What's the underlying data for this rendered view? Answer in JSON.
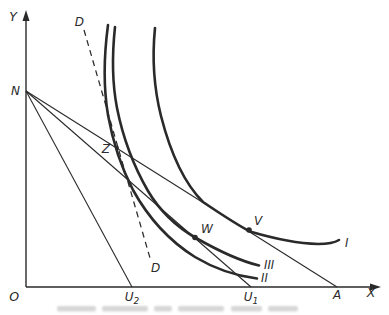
{
  "labels": {
    "y_axis": "Y",
    "x_axis": "X",
    "origin": "O",
    "n": "N",
    "d_top": "D",
    "d_bottom": "D",
    "z": "Z",
    "w": "W",
    "v": "V",
    "u_base": "U",
    "u2_sub": "2",
    "u1_sub": "1",
    "a": "A",
    "curve_i": "I",
    "curve_ii": "II",
    "curve_iii": "III"
  },
  "colors": {
    "ink": "#2a2a2a",
    "paper": "#ffffff",
    "smudge": "#c9c9c9"
  },
  "figure": {
    "y_axis": {
      "x1": 26,
      "y1": 287,
      "x2": 26,
      "y2": 17
    },
    "x_axis": {
      "x1": 26,
      "y1": 287,
      "x2": 375,
      "y2": 287
    },
    "y_arrow": {
      "points": "26,10 22.5,21 29.5,21"
    },
    "x_arrow": {
      "points": "381,287 370,283.5 370,290.5"
    },
    "line_n_u2": {
      "x1": 26,
      "y1": 91,
      "x2": 132,
      "y2": 287
    },
    "line_n_u1": {
      "x1": 26,
      "y1": 91,
      "x2": 251,
      "y2": 287
    },
    "line_n_a": {
      "x1": 26,
      "y1": 91,
      "x2": 337,
      "y2": 287
    },
    "d_line": {
      "x1": 84,
      "y1": 30,
      "x2": 150,
      "y2": 258
    },
    "curve_i": {
      "d": "M 155,28 C 152,58 154,88 161,116 C 171,155 184,183 203,202 C 221,214 234,223 250,231.5 C 272,238 297,243.5 318,244 C 329,244 335,242.5 339,240"
    },
    "curve_ii": {
      "d": "M 108,25 C 104,55 103,85 108,115 C 113,143 121,167 133,190 C 149,219 171,242 195,257 C 215,269 237,276 257,278.5"
    },
    "curve_iii": {
      "d": "M 115,27 C 112,55 112,82 117,108 C 123,138 133,165 148,191 C 161,213 177,227 196,238 C 217,250 240,261 259,265.5"
    },
    "dot_z": {
      "cx": 117,
      "cy": 148,
      "r": 2
    },
    "dot_w": {
      "cx": 195,
      "cy": 237.5,
      "r": 2.8
    },
    "dot_v": {
      "cx": 249,
      "cy": 230,
      "r": 2.8
    },
    "txt_y": {
      "x": 13,
      "y": 21,
      "text-anchor": "middle"
    },
    "txt_x": {
      "x": 371,
      "y": 297,
      "text-anchor": "middle"
    },
    "txt_o": {
      "x": 19,
      "y": 301,
      "text-anchor": "end"
    },
    "txt_n": {
      "x": 20,
      "y": 95,
      "text-anchor": "end"
    },
    "txt_d_top": {
      "x": 84,
      "y": 26,
      "text-anchor": "end"
    },
    "txt_d_bottom": {
      "x": 151,
      "y": 272,
      "text-anchor": "start"
    },
    "txt_z": {
      "x": 110,
      "y": 153,
      "text-anchor": "end"
    },
    "txt_w": {
      "x": 201,
      "y": 233,
      "text-anchor": "start"
    },
    "txt_v": {
      "x": 254,
      "y": 225,
      "text-anchor": "start"
    },
    "txt_u2": {
      "x": 132,
      "y": 301,
      "text-anchor": "middle"
    },
    "txt_u1": {
      "x": 251,
      "y": 301,
      "text-anchor": "middle"
    },
    "txt_a": {
      "x": 337,
      "y": 299,
      "text-anchor": "middle"
    },
    "txt_i": {
      "x": 345,
      "y": 247,
      "text-anchor": "start"
    },
    "txt_ii": {
      "x": 261,
      "y": 282,
      "text-anchor": "start"
    },
    "txt_iii": {
      "x": 264,
      "y": 269,
      "text-anchor": "start"
    },
    "smudge": [
      {
        "x": 57,
        "y": 306,
        "width": 39,
        "height": 5.5,
        "rx": 2
      },
      {
        "x": 102,
        "y": 306,
        "width": 46,
        "height": 5.5,
        "rx": 2
      },
      {
        "x": 154,
        "y": 306,
        "width": 18,
        "height": 5.5,
        "rx": 2
      },
      {
        "x": 178,
        "y": 306,
        "width": 46,
        "height": 5.5,
        "rx": 2
      },
      {
        "x": 231,
        "y": 306,
        "width": 31,
        "height": 5.5,
        "rx": 2
      },
      {
        "x": 268,
        "y": 306,
        "width": 30,
        "height": 5.5,
        "rx": 2
      }
    ]
  }
}
